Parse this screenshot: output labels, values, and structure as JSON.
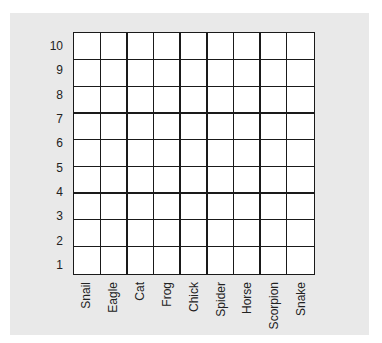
{
  "y_labels": [
    "10",
    "9",
    "8",
    "7",
    "6",
    "5",
    "4",
    "3",
    "2",
    "1"
  ],
  "x_labels": [
    "Snail",
    "Eagle",
    "Cat",
    "Frog",
    "Chick",
    "Spider",
    "Horse",
    "Scorpion",
    "Snake"
  ],
  "grid": {
    "rows": 9,
    "columns": 9
  },
  "colors": {
    "panel": "#e9e9e9",
    "grid_lines": "#1a1a1a",
    "cells": "#ffffff"
  }
}
